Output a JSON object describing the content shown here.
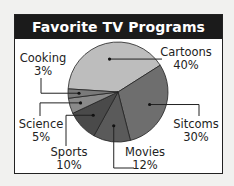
{
  "chart_data": {
    "type": "pie",
    "title": "Favorite TV Programs",
    "categories": [
      "Cartoons",
      "Sitcoms",
      "Movies",
      "Sports",
      "Science",
      "Cooking"
    ],
    "values": [
      40,
      30,
      12,
      10,
      5,
      3
    ],
    "unit": "%",
    "colors": [
      "#bdbdbd",
      "#6e6e6e",
      "#5a5a5a",
      "#4a4a4a",
      "#8a8a8a",
      "#7a7a7a"
    ],
    "legend": "none (leader-line labels)"
  },
  "labels": [
    {
      "name": "Cartoons",
      "pct": "40%"
    },
    {
      "name": "Sitcoms",
      "pct": "30%"
    },
    {
      "name": "Movies",
      "pct": "12%"
    },
    {
      "name": "Sports",
      "pct": "10%"
    },
    {
      "name": "Science",
      "pct": "5%"
    },
    {
      "name": "Cooking",
      "pct": "3%"
    }
  ]
}
